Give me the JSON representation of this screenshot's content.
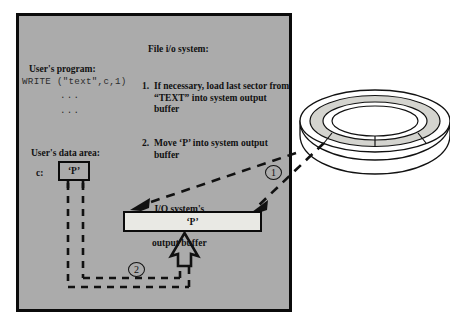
{
  "figure": {
    "background_color": "#ffffff",
    "panel_color": "#ababab",
    "buffer_fill_color": "#e9e9e4",
    "stroke_color": "#0b0b0b"
  },
  "program": {
    "heading": "User's program:",
    "code_line": "WRITE (\"text\",c,1)",
    "continuation_1": "...",
    "continuation_2": "..."
  },
  "file_io": {
    "heading": "File i/o system:",
    "steps": [
      {
        "number": "1.",
        "text": "If necessary, load last sector from “TEXT” into system output buffer"
      },
      {
        "number": "2.",
        "text": "Move ‘P’ into system output buffer"
      }
    ]
  },
  "data_area": {
    "heading": "User's data area:",
    "variable_label": "c:",
    "variable_value": "‘P’"
  },
  "buffer": {
    "label_line_1": "I/O system's",
    "label_line_2": "output buffer",
    "value": "‘P’"
  },
  "markers": {
    "step_one": "1",
    "step_two": "2"
  },
  "disk": {
    "name": "disk-platter"
  }
}
